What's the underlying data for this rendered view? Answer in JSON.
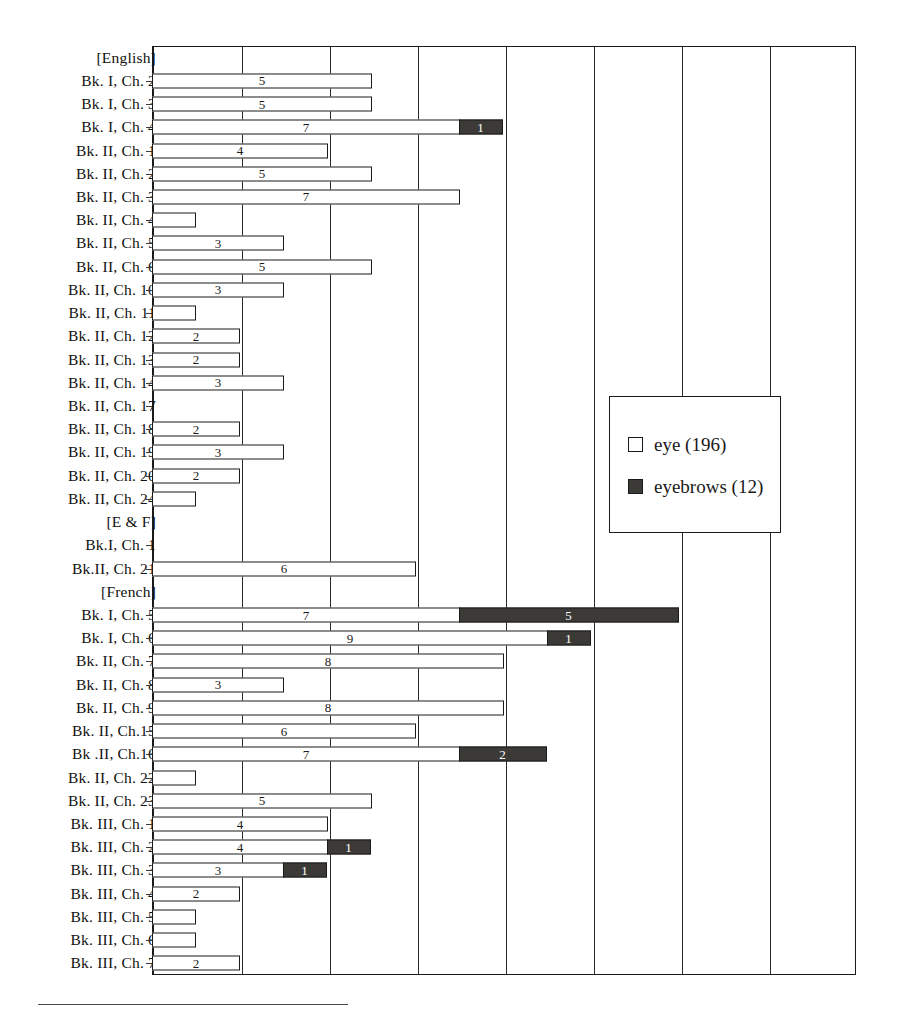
{
  "chart_data": {
    "type": "bar",
    "orientation": "horizontal",
    "stacked": true,
    "title": "",
    "subtitle": "",
    "xlabel": "",
    "ylabel": "",
    "xlim": [
      0,
      16
    ],
    "xtick_interval": 2,
    "grid": true,
    "gridlines_x": [
      2,
      4,
      6,
      8,
      10,
      12,
      14,
      16
    ],
    "legend_position": "middle-right",
    "legend": [
      {
        "name": "eye",
        "total": 196,
        "label": "eye (196)",
        "color": "#ffffff",
        "swatch": "white-square"
      },
      {
        "name": "eyebrows",
        "total": 12,
        "label": "eyebrows (12)",
        "color": "#3c3a36",
        "swatch": "dark-square"
      }
    ],
    "series": [
      {
        "name": "eye",
        "color": "#ffffff"
      },
      {
        "name": "eyebrows",
        "color": "#3c3a36"
      }
    ],
    "categories": [
      "[English]",
      "Bk. I, Ch. 2",
      "Bk. I, Ch. 3",
      "Bk. I, Ch. 4",
      "Bk. II, Ch. 1",
      "Bk. II, Ch. 2",
      "Bk. II, Ch. 3",
      "Bk. II, Ch. 4",
      "Bk. II, Ch. 5",
      "Bk. II, Ch. 6",
      "Bk. II, Ch. 10",
      "Bk. II, Ch. 11",
      "Bk. II, Ch. 12",
      "Bk. II, Ch. 13",
      "Bk. II, Ch. 14",
      "Bk. II, Ch. 17",
      "Bk. II, Ch. 18",
      "Bk. II, Ch. 19",
      "Bk. II, Ch. 20",
      "Bk. II, Ch. 24",
      "[E & F]",
      "Bk.I, Ch. 1",
      "Bk.II, Ch. 21",
      "[French]",
      "Bk. I, Ch. 5",
      "Bk. I, Ch. 6",
      "Bk. II, Ch. 7",
      "Bk. II, Ch. 8",
      "Bk. II, Ch. 9",
      "Bk. II, Ch.15",
      "Bk .II, Ch.16",
      "Bk. II, Ch. 22",
      "Bk. II, Ch. 23",
      "Bk. III, Ch. 1",
      "Bk. III, Ch. 2",
      "Bk. III, Ch. 3",
      "Bk. III, Ch. 4",
      "Bk. III, Ch. 5",
      "Bk. III, Ch. 6",
      "Bk. III, Ch. 7"
    ],
    "eye_values": [
      null,
      5,
      5,
      7,
      4,
      5,
      7,
      1,
      3,
      5,
      3,
      1,
      2,
      2,
      3,
      0,
      2,
      3,
      2,
      1,
      null,
      0,
      6,
      null,
      7,
      9,
      8,
      3,
      8,
      6,
      7,
      1,
      5,
      4,
      4,
      3,
      2,
      1,
      1,
      2
    ],
    "eyebrows_values": [
      null,
      0,
      0,
      1,
      0,
      0,
      0,
      0,
      0,
      0,
      0,
      0,
      0,
      0,
      0,
      0,
      0,
      0,
      0,
      0,
      null,
      0,
      0,
      null,
      5,
      1,
      0,
      0,
      0,
      0,
      2,
      0,
      0,
      0,
      1,
      1,
      0,
      0,
      0,
      0
    ],
    "rows": [
      {
        "label": "[English]",
        "header": true,
        "eye": null,
        "eyebrows": null,
        "eye_label": "",
        "eyebrows_label": ""
      },
      {
        "label": "Bk. I, Ch. 2",
        "header": false,
        "eye": 5,
        "eyebrows": 0,
        "eye_label": "5",
        "eyebrows_label": ""
      },
      {
        "label": "Bk. I, Ch. 3",
        "header": false,
        "eye": 5,
        "eyebrows": 0,
        "eye_label": "5",
        "eyebrows_label": ""
      },
      {
        "label": "Bk. I, Ch. 4",
        "header": false,
        "eye": 7,
        "eyebrows": 1,
        "eye_label": "7",
        "eyebrows_label": "1"
      },
      {
        "label": "Bk. II, Ch. 1",
        "header": false,
        "eye": 4,
        "eyebrows": 0,
        "eye_label": "4",
        "eyebrows_label": ""
      },
      {
        "label": "Bk. II, Ch. 2",
        "header": false,
        "eye": 5,
        "eyebrows": 0,
        "eye_label": "5",
        "eyebrows_label": ""
      },
      {
        "label": "Bk. II, Ch. 3",
        "header": false,
        "eye": 7,
        "eyebrows": 0,
        "eye_label": "7",
        "eyebrows_label": ""
      },
      {
        "label": "Bk. II, Ch. 4",
        "header": false,
        "eye": 1,
        "eyebrows": 0,
        "eye_label": "",
        "eyebrows_label": ""
      },
      {
        "label": "Bk. II, Ch. 5",
        "header": false,
        "eye": 3,
        "eyebrows": 0,
        "eye_label": "3",
        "eyebrows_label": ""
      },
      {
        "label": "Bk. II, Ch. 6",
        "header": false,
        "eye": 5,
        "eyebrows": 0,
        "eye_label": "5",
        "eyebrows_label": ""
      },
      {
        "label": "Bk. II, Ch. 10",
        "header": false,
        "eye": 3,
        "eyebrows": 0,
        "eye_label": "3",
        "eyebrows_label": ""
      },
      {
        "label": "Bk. II, Ch. 11",
        "header": false,
        "eye": 1,
        "eyebrows": 0,
        "eye_label": "",
        "eyebrows_label": ""
      },
      {
        "label": "Bk. II, Ch. 12",
        "header": false,
        "eye": 2,
        "eyebrows": 0,
        "eye_label": "2",
        "eyebrows_label": ""
      },
      {
        "label": "Bk. II, Ch. 13",
        "header": false,
        "eye": 2,
        "eyebrows": 0,
        "eye_label": "2",
        "eyebrows_label": ""
      },
      {
        "label": "Bk. II, Ch. 14",
        "header": false,
        "eye": 3,
        "eyebrows": 0,
        "eye_label": "3",
        "eyebrows_label": ""
      },
      {
        "label": "Bk. II, Ch. 17",
        "header": false,
        "eye": 0,
        "eyebrows": 0,
        "eye_label": "",
        "eyebrows_label": ""
      },
      {
        "label": "Bk. II, Ch. 18",
        "header": false,
        "eye": 2,
        "eyebrows": 0,
        "eye_label": "2",
        "eyebrows_label": ""
      },
      {
        "label": "Bk. II, Ch. 19",
        "header": false,
        "eye": 3,
        "eyebrows": 0,
        "eye_label": "3",
        "eyebrows_label": ""
      },
      {
        "label": "Bk. II, Ch. 20",
        "header": false,
        "eye": 2,
        "eyebrows": 0,
        "eye_label": "2",
        "eyebrows_label": ""
      },
      {
        "label": "Bk. II, Ch. 24",
        "header": false,
        "eye": 1,
        "eyebrows": 0,
        "eye_label": "",
        "eyebrows_label": ""
      },
      {
        "label": "[E & F]",
        "header": true,
        "eye": null,
        "eyebrows": null,
        "eye_label": "",
        "eyebrows_label": ""
      },
      {
        "label": "Bk.I, Ch. 1",
        "header": false,
        "eye": 0,
        "eyebrows": 0,
        "eye_label": "",
        "eyebrows_label": ""
      },
      {
        "label": "Bk.II, Ch. 21",
        "header": false,
        "eye": 6,
        "eyebrows": 0,
        "eye_label": "6",
        "eyebrows_label": ""
      },
      {
        "label": "[French]",
        "header": true,
        "eye": null,
        "eyebrows": null,
        "eye_label": "",
        "eyebrows_label": ""
      },
      {
        "label": "Bk. I, Ch. 5",
        "header": false,
        "eye": 7,
        "eyebrows": 5,
        "eye_label": "7",
        "eyebrows_label": "5"
      },
      {
        "label": "Bk. I, Ch. 6",
        "header": false,
        "eye": 9,
        "eyebrows": 1,
        "eye_label": "9",
        "eyebrows_label": "1"
      },
      {
        "label": "Bk. II, Ch. 7",
        "header": false,
        "eye": 8,
        "eyebrows": 0,
        "eye_label": "8",
        "eyebrows_label": ""
      },
      {
        "label": "Bk. II, Ch. 8",
        "header": false,
        "eye": 3,
        "eyebrows": 0,
        "eye_label": "3",
        "eyebrows_label": ""
      },
      {
        "label": "Bk. II, Ch. 9",
        "header": false,
        "eye": 8,
        "eyebrows": 0,
        "eye_label": "8",
        "eyebrows_label": ""
      },
      {
        "label": "Bk. II, Ch.15",
        "header": false,
        "eye": 6,
        "eyebrows": 0,
        "eye_label": "6",
        "eyebrows_label": ""
      },
      {
        "label": "Bk .II, Ch.16",
        "header": false,
        "eye": 7,
        "eyebrows": 2,
        "eye_label": "7",
        "eyebrows_label": "2"
      },
      {
        "label": "Bk. II, Ch. 22",
        "header": false,
        "eye": 1,
        "eyebrows": 0,
        "eye_label": "",
        "eyebrows_label": ""
      },
      {
        "label": "Bk. II, Ch. 23",
        "header": false,
        "eye": 5,
        "eyebrows": 0,
        "eye_label": "5",
        "eyebrows_label": ""
      },
      {
        "label": "Bk. III, Ch. 1",
        "header": false,
        "eye": 4,
        "eyebrows": 0,
        "eye_label": "4",
        "eyebrows_label": ""
      },
      {
        "label": "Bk. III, Ch. 2",
        "header": false,
        "eye": 4,
        "eyebrows": 1,
        "eye_label": "4",
        "eyebrows_label": "1"
      },
      {
        "label": "Bk. III, Ch. 3",
        "header": false,
        "eye": 3,
        "eyebrows": 1,
        "eye_label": "3",
        "eyebrows_label": "1"
      },
      {
        "label": "Bk. III, Ch. 4",
        "header": false,
        "eye": 2,
        "eyebrows": 0,
        "eye_label": "2",
        "eyebrows_label": ""
      },
      {
        "label": "Bk. III, Ch. 5",
        "header": false,
        "eye": 1,
        "eyebrows": 0,
        "eye_label": "",
        "eyebrows_label": ""
      },
      {
        "label": "Bk. III, Ch. 6",
        "header": false,
        "eye": 1,
        "eyebrows": 0,
        "eye_label": "",
        "eyebrows_label": ""
      },
      {
        "label": "Bk. III, Ch. 7",
        "header": false,
        "eye": 2,
        "eyebrows": 0,
        "eye_label": "2",
        "eyebrows_label": ""
      }
    ]
  }
}
